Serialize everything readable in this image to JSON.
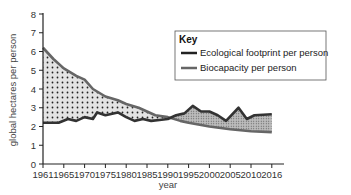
{
  "chart_data": {
    "type": "line",
    "title": "",
    "xlabel": "year",
    "ylabel": "global hectares per person",
    "ylim": [
      0,
      8
    ],
    "yticks": [
      0,
      1,
      2,
      3,
      4,
      5,
      6,
      7,
      8
    ],
    "xtick_labels": [
      "1961",
      "1965",
      "1970",
      "1975",
      "1980",
      "1985",
      "1990",
      "1995",
      "2000",
      "2005",
      "2010",
      "2016"
    ],
    "grid": false,
    "legend": {
      "title": "Key",
      "position": "upper right",
      "entries": [
        "Ecological footprint per person",
        "Biocapacity per person"
      ]
    },
    "series": [
      {
        "name": "Ecological footprint per person",
        "color": "#333333",
        "x": [
          1961,
          1964,
          1966,
          1968,
          1970,
          1972,
          1973,
          1975,
          1978,
          1980,
          1982,
          1984,
          1986,
          1988,
          1990,
          1992,
          1994,
          1996,
          1998,
          2000,
          2002,
          2004,
          2007,
          2009,
          2011,
          2016
        ],
        "values": [
          2.2,
          2.2,
          2.4,
          2.3,
          2.5,
          2.4,
          2.75,
          2.6,
          2.75,
          2.5,
          2.3,
          2.4,
          2.3,
          2.35,
          2.4,
          2.6,
          2.7,
          3.1,
          2.8,
          2.8,
          2.6,
          2.3,
          3.0,
          2.4,
          2.6,
          2.65
        ]
      },
      {
        "name": "Biocapacity per person",
        "color": "#666666",
        "x": [
          1961,
          1963,
          1965,
          1968,
          1970,
          1972,
          1975,
          1978,
          1980,
          1983,
          1985,
          1987,
          1990,
          1993,
          1995,
          2000,
          2005,
          2010,
          2016
        ],
        "values": [
          6.2,
          5.6,
          5.1,
          4.7,
          4.5,
          4.0,
          3.6,
          3.4,
          3.2,
          3.0,
          2.8,
          2.6,
          2.5,
          2.3,
          2.2,
          2.0,
          1.85,
          1.75,
          1.7
        ]
      }
    ],
    "annotations": [
      "dotted fill between biocapacity and footprint where biocapacity > footprint (reserve)",
      "fine stippled fill between footprint and biocapacity where footprint > biocapacity (deficit)"
    ]
  }
}
